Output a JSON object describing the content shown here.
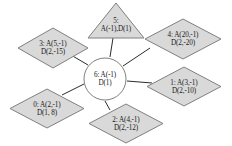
{
  "diagram": {
    "type": "node-link-graph",
    "background": "#ffffff",
    "shape_fill": "#d9d9d9",
    "shape_stroke": "#808080",
    "edge_color": "#2b2b2b",
    "text_color": "#1a1a1a",
    "center": {
      "id": "6",
      "shape": "circle",
      "line1": "6: A(-1)",
      "line2": "D(1)",
      "cx": 105,
      "cy": 79,
      "r": 22
    },
    "nodes": [
      {
        "id": "5",
        "shape": "triangle",
        "line1": "5:",
        "line2": "A(-1),D(1)",
        "x": 87,
        "y": 2,
        "w": 58,
        "h": 37
      },
      {
        "id": "3",
        "shape": "diamond",
        "line1": "3: A(5,-1)",
        "line2": "D(2,-15)",
        "x": 17,
        "y": 27,
        "w": 72,
        "h": 42
      },
      {
        "id": "4",
        "shape": "diamond",
        "line1": "4: A(20,-1)",
        "line2": "D(2,-20)",
        "x": 144,
        "y": 18,
        "w": 78,
        "h": 42
      },
      {
        "id": "1",
        "shape": "diamond",
        "line1": "1: A(3,-1)",
        "line2": "D(2,-10)",
        "x": 146,
        "y": 66,
        "w": 76,
        "h": 41
      },
      {
        "id": "0",
        "shape": "diamond",
        "line1": "0: A(2,-1)",
        "line2": "D(1, 8)",
        "x": 9,
        "y": 88,
        "w": 76,
        "h": 41
      },
      {
        "id": "2",
        "shape": "diamond",
        "line1": "2: A(4,-1)",
        "line2": "D(2,-12)",
        "x": 88,
        "y": 103,
        "w": 76,
        "h": 41
      }
    ],
    "edges": [
      {
        "from": "6",
        "to": "5",
        "x1": 110,
        "y1": 57,
        "x2": 113,
        "y2": 38
      },
      {
        "from": "6",
        "to": "3",
        "x1": 88,
        "y1": 65,
        "x2": 71,
        "y2": 55
      },
      {
        "from": "6",
        "to": "4",
        "x1": 123,
        "y1": 66,
        "x2": 150,
        "y2": 48
      },
      {
        "from": "6",
        "to": "1",
        "x1": 127,
        "y1": 81,
        "x2": 152,
        "y2": 83
      },
      {
        "from": "6",
        "to": "0",
        "x1": 84,
        "y1": 84,
        "x2": 62,
        "y2": 95
      },
      {
        "from": "6",
        "to": "2",
        "x1": 105,
        "y1": 101,
        "x2": 110,
        "y2": 110
      }
    ]
  }
}
